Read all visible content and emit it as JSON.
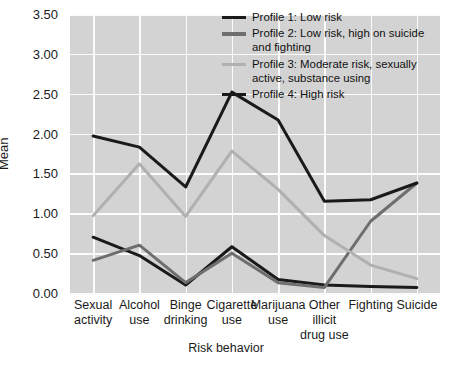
{
  "chart_data": {
    "type": "line",
    "title": "",
    "xlabel": "Risk behavior",
    "ylabel": "Mean",
    "categories": [
      "Sexual\nactivity",
      "Alcohol\nuse",
      "Binge\ndrinking",
      "Cigarette\nuse",
      "Marijuana\nuse",
      "Other\nillicit\ndrug use",
      "Fighting",
      "Suicide"
    ],
    "ylim": [
      0.0,
      3.5
    ],
    "yticks": [
      "0.00",
      "0.50",
      "1.00",
      "1.50",
      "2.00",
      "2.50",
      "3.00",
      "3.50"
    ],
    "ytick_values": [
      0.0,
      0.5,
      1.0,
      1.5,
      2.0,
      2.5,
      3.0,
      3.5
    ],
    "grid": true,
    "legend_position": "top-right",
    "series": [
      {
        "name": "Profile 1: Low risk",
        "color": "#1a1a1a",
        "values": [
          0.7,
          0.47,
          0.1,
          0.58,
          0.17,
          0.1,
          0.08,
          0.07
        ]
      },
      {
        "name": "Profile 2: Low risk, high on suicide and fighting",
        "color": "#6e6e6e",
        "values": [
          0.41,
          0.6,
          0.13,
          0.5,
          0.13,
          0.07,
          0.9,
          1.38
        ]
      },
      {
        "name": "Profile 3: Moderate risk, sexually active, substance using",
        "color": "#b0b0b0",
        "values": [
          0.97,
          1.62,
          0.96,
          1.78,
          1.3,
          0.72,
          0.35,
          0.18
        ]
      },
      {
        "name": "Profile 4: High risk",
        "color": "#1a1a1a",
        "values": [
          1.97,
          1.83,
          1.33,
          2.52,
          2.17,
          1.15,
          1.17,
          1.38
        ]
      }
    ]
  },
  "legend": {
    "entries": [
      {
        "label": "Profile 1: Low risk",
        "color": "#1a1a1a"
      },
      {
        "label": "Profile 2: Low risk, high on suicide and fighting",
        "color": "#6e6e6e"
      },
      {
        "label": "Profile 3: Moderate risk, sexually active, substance using",
        "color": "#b0b0b0"
      },
      {
        "label": "Profile 4: High risk",
        "color": "#1a1a1a"
      }
    ]
  },
  "colors": {
    "plot_background": "#d3d3d3",
    "grid": "#fbfbfb",
    "page_background": "#ffffff",
    "text": "#1b1b1b"
  }
}
